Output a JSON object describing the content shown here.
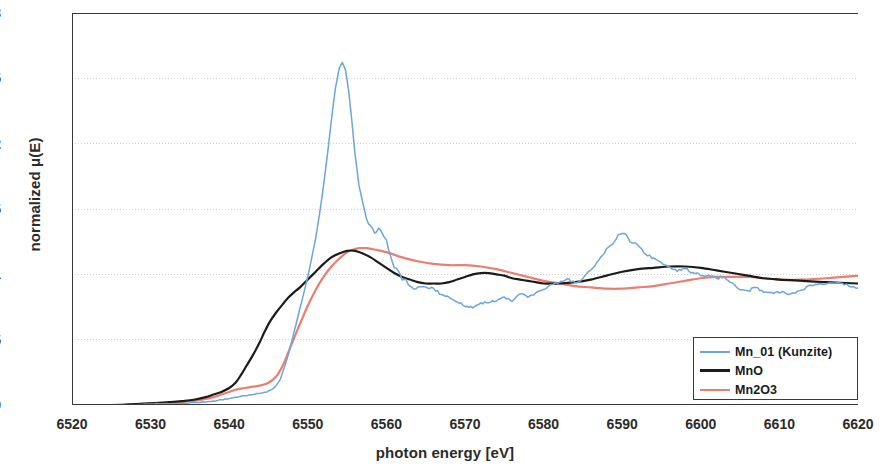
{
  "chart_data": {
    "type": "line",
    "title": "",
    "xlabel": "photon energy [eV]",
    "ylabel": "normalized μ(E)",
    "xlim": [
      6520,
      6620
    ],
    "ylim": [
      0,
      3
    ],
    "xticks": [
      6520,
      6530,
      6540,
      6550,
      6560,
      6570,
      6580,
      6590,
      6600,
      6610,
      6620
    ],
    "yticks": [
      0,
      0.5,
      1,
      1.5,
      2,
      2.5,
      3
    ],
    "grid": "horizontal-dotted",
    "legend_position": "bottom-right",
    "series": [
      {
        "name": "Mn_01 (Kunzite)",
        "color": "#6CA6DC",
        "noisy": true,
        "x": [
          6520,
          6524,
          6528,
          6531,
          6534,
          6536,
          6538,
          6539,
          6540,
          6541,
          6542,
          6543,
          6544,
          6544.8,
          6545.5,
          6546,
          6546.5,
          6547,
          6547.5,
          6548,
          6548.5,
          6549,
          6549.5,
          6550,
          6550.5,
          6551,
          6551.5,
          6552,
          6552.5,
          6553,
          6553.5,
          6554,
          6554.4,
          6554.8,
          6555.2,
          6555.6,
          6556,
          6556.5,
          6557,
          6557.5,
          6558,
          6558.5,
          6559,
          6559.5,
          6560,
          6560.5,
          6561,
          6561.5,
          6562,
          6562.5,
          6563,
          6563.5,
          6564,
          6564.5,
          6565,
          6566,
          6567,
          6568,
          6569,
          6570,
          6571,
          6572,
          6573,
          6574,
          6575,
          6576,
          6577,
          6578,
          6579,
          6580,
          6581,
          6582,
          6583,
          6584,
          6585,
          6586,
          6587,
          6588,
          6589,
          6589.5,
          6590,
          6590.5,
          6591,
          6592,
          6593,
          6594,
          6595,
          6596,
          6597,
          6598,
          6599,
          6600,
          6601,
          6602,
          6603,
          6604,
          6605,
          6606,
          6607,
          6608,
          6609,
          6610,
          6612,
          6614,
          6616,
          6618,
          6620
        ],
        "y": [
          0.0,
          0.0,
          0.0,
          0.01,
          0.01,
          0.02,
          0.03,
          0.04,
          0.05,
          0.06,
          0.07,
          0.08,
          0.09,
          0.1,
          0.12,
          0.15,
          0.2,
          0.28,
          0.38,
          0.5,
          0.62,
          0.74,
          0.86,
          0.98,
          1.12,
          1.28,
          1.46,
          1.68,
          1.92,
          2.18,
          2.42,
          2.58,
          2.62,
          2.56,
          2.4,
          2.18,
          1.92,
          1.68,
          1.52,
          1.42,
          1.38,
          1.34,
          1.34,
          1.3,
          1.24,
          1.16,
          1.08,
          1.02,
          0.98,
          0.94,
          0.92,
          0.9,
          0.9,
          0.92,
          0.93,
          0.9,
          0.86,
          0.8,
          0.77,
          0.76,
          0.77,
          0.79,
          0.8,
          0.81,
          0.82,
          0.82,
          0.83,
          0.84,
          0.86,
          0.88,
          0.9,
          0.92,
          0.94,
          0.96,
          0.99,
          1.04,
          1.12,
          1.2,
          1.27,
          1.29,
          1.3,
          1.28,
          1.26,
          1.22,
          1.18,
          1.14,
          1.1,
          1.07,
          1.04,
          1.02,
          1.01,
          1.0,
          0.99,
          0.97,
          0.95,
          0.93,
          0.91,
          0.9,
          0.89,
          0.88,
          0.88,
          0.88,
          0.88,
          0.89,
          0.9,
          0.9,
          0.88
        ]
      },
      {
        "name": "MnO",
        "color": "#1b1b1b",
        "noisy": false,
        "x": [
          6520,
          6525,
          6529,
          6532,
          6534,
          6535.5,
          6537,
          6538,
          6539,
          6540,
          6540.8,
          6541.5,
          6542.2,
          6543,
          6543.8,
          6544.5,
          6545.2,
          6546,
          6546.8,
          6547.5,
          6548.2,
          6549,
          6550,
          6551,
          6552,
          6553,
          6554,
          6555,
          6556,
          6557,
          6558,
          6559,
          6560,
          6561,
          6562,
          6563,
          6564,
          6565,
          6566,
          6567,
          6568,
          6569,
          6570,
          6571,
          6572,
          6573,
          6574,
          6575,
          6576,
          6577,
          6578,
          6579,
          6580,
          6581,
          6582,
          6584,
          6586,
          6588,
          6590,
          6592,
          6594,
          6596,
          6598,
          6600,
          6602,
          6604,
          6606,
          6608,
          6610,
          6613,
          6616,
          6620
        ],
        "y": [
          0.0,
          0.0,
          0.01,
          0.02,
          0.03,
          0.04,
          0.06,
          0.08,
          0.1,
          0.13,
          0.17,
          0.23,
          0.3,
          0.38,
          0.47,
          0.56,
          0.64,
          0.71,
          0.77,
          0.82,
          0.86,
          0.9,
          0.96,
          1.02,
          1.08,
          1.13,
          1.16,
          1.18,
          1.18,
          1.16,
          1.13,
          1.09,
          1.05,
          1.01,
          0.98,
          0.96,
          0.94,
          0.93,
          0.93,
          0.93,
          0.94,
          0.96,
          0.98,
          1.0,
          1.01,
          1.01,
          1.0,
          0.99,
          0.97,
          0.96,
          0.95,
          0.94,
          0.93,
          0.93,
          0.93,
          0.94,
          0.96,
          0.99,
          1.02,
          1.04,
          1.05,
          1.06,
          1.06,
          1.05,
          1.03,
          1.01,
          0.99,
          0.97,
          0.96,
          0.95,
          0.94,
          0.93
        ]
      },
      {
        "name": "Mn2O3",
        "color": "#ED7D6E",
        "noisy": false,
        "x": [
          6520,
          6526,
          6530,
          6533,
          6535,
          6536.5,
          6538,
          6539,
          6540,
          6541,
          6542,
          6543,
          6544,
          6545,
          6546,
          6546.8,
          6547.5,
          6548.3,
          6549,
          6550,
          6551,
          6552,
          6553,
          6554,
          6555,
          6555.8,
          6556.6,
          6557.5,
          6558.5,
          6560,
          6562,
          6564,
          6566,
          6568,
          6570,
          6572,
          6574,
          6576,
          6578,
          6580,
          6582,
          6584,
          6586,
          6588,
          6590,
          6592,
          6594,
          6596,
          6598,
          6600,
          6602,
          6604,
          6606,
          6608,
          6610,
          6613,
          6616,
          6620
        ],
        "y": [
          0.0,
          0.0,
          0.01,
          0.02,
          0.03,
          0.04,
          0.06,
          0.08,
          0.1,
          0.12,
          0.13,
          0.14,
          0.15,
          0.17,
          0.22,
          0.3,
          0.4,
          0.52,
          0.62,
          0.76,
          0.88,
          0.98,
          1.06,
          1.12,
          1.17,
          1.19,
          1.2,
          1.2,
          1.19,
          1.17,
          1.13,
          1.1,
          1.08,
          1.07,
          1.07,
          1.06,
          1.04,
          1.01,
          0.98,
          0.95,
          0.93,
          0.91,
          0.9,
          0.89,
          0.89,
          0.9,
          0.91,
          0.93,
          0.95,
          0.97,
          0.98,
          0.98,
          0.98,
          0.97,
          0.96,
          0.96,
          0.97,
          0.99
        ]
      }
    ]
  },
  "legend": {
    "entries": [
      {
        "label": "Mn_01 (Kunzite)",
        "color": "#6CA6DC"
      },
      {
        "label": "MnO",
        "color": "#1b1b1b"
      },
      {
        "label": "Mn2O3",
        "color": "#ED7D6E"
      }
    ]
  },
  "axes": {
    "axis_color": "#3a3a3a",
    "grid_color": "#cfcfcf"
  }
}
